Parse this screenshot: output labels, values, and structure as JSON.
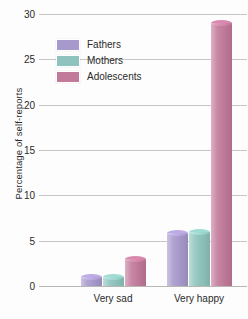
{
  "chart_data": {
    "type": "bar",
    "title": "",
    "subtitle": "",
    "xlabel": "",
    "ylabel": "Percentage of self-reports",
    "categories": [
      "Very sad",
      "Very happy"
    ],
    "series": [
      {
        "name": "Fathers",
        "color": "#a899cc",
        "values": [
          1.0,
          5.8
        ]
      },
      {
        "name": "Mothers",
        "color": "#8ec4bd",
        "values": [
          1.0,
          6.0
        ]
      },
      {
        "name": "Adolescents",
        "color": "#c27a9b",
        "values": [
          3.0,
          29.0
        ]
      }
    ],
    "ylim": [
      0,
      30
    ],
    "yticks": [
      0,
      5,
      10,
      15,
      20,
      25,
      30
    ],
    "ytick_labels": [
      "0",
      "5",
      "10",
      "15",
      "20",
      "25",
      "30"
    ],
    "grid": true,
    "legend_position": "upper-left-inside",
    "background_color": "#fdfdfd",
    "gridline_color": "#c8c6c2",
    "axis_color": "#b9b7b3",
    "text_color": "#2a2a2a"
  }
}
